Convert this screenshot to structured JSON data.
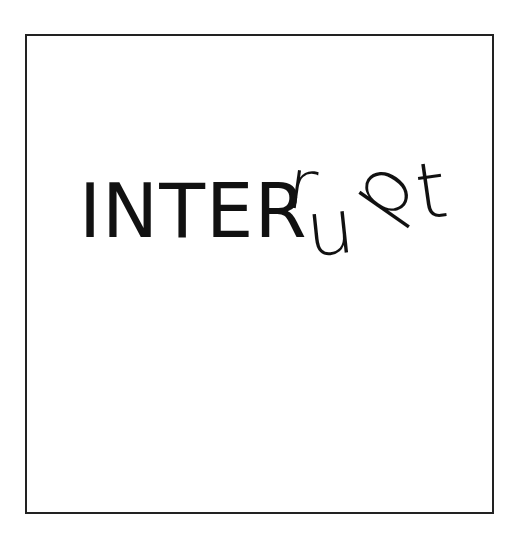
{
  "artwork": {
    "title_static": "INTER",
    "title_scattered": [
      "r",
      "u",
      "p",
      "t"
    ],
    "full_word": "INTERrupt",
    "colors": {
      "background": "#ffffff",
      "frame": "#222222",
      "text": "#111111"
    }
  }
}
